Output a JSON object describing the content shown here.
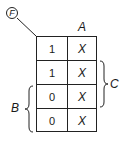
{
  "diagram": {
    "type": "karnaugh-map",
    "function_label": "F",
    "column_variable": "A",
    "row_brackets": [
      {
        "label": "C",
        "side": "right",
        "rows": [
          1,
          2
        ]
      },
      {
        "label": "B",
        "side": "left",
        "rows": [
          2,
          3
        ]
      }
    ],
    "cells": [
      [
        "1",
        "X"
      ],
      [
        "1",
        "X"
      ],
      [
        "0",
        "X"
      ],
      [
        "0",
        "X"
      ]
    ]
  }
}
